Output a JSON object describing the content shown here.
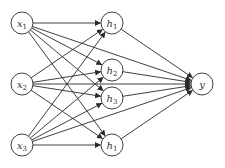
{
  "diagram": {
    "type": "neural-network",
    "colors": {
      "stroke": "#2a2a2a",
      "node_fill": "#ffffff",
      "text": "#333333"
    },
    "layers": [
      {
        "name": "input",
        "nodes": [
          {
            "id": "x1",
            "base": "x",
            "sub": "1",
            "x": 22,
            "y": 23
          },
          {
            "id": "x2",
            "base": "x",
            "sub": "2",
            "x": 22,
            "y": 84
          },
          {
            "id": "x3",
            "base": "x",
            "sub": "3",
            "x": 22,
            "y": 145
          }
        ]
      },
      {
        "name": "hidden",
        "nodes": [
          {
            "id": "h1",
            "base": "h",
            "sub": "1",
            "x": 112,
            "y": 23
          },
          {
            "id": "h2",
            "base": "h",
            "sub": "2",
            "x": 112,
            "y": 70
          },
          {
            "id": "h3",
            "base": "h",
            "sub": "3",
            "x": 112,
            "y": 98
          },
          {
            "id": "h4",
            "base": "h",
            "sub": "1",
            "x": 112,
            "y": 145
          }
        ]
      },
      {
        "name": "output",
        "nodes": [
          {
            "id": "y",
            "base": "y",
            "sub": "",
            "x": 202,
            "y": 84
          }
        ]
      }
    ],
    "node_radius": 11
  }
}
